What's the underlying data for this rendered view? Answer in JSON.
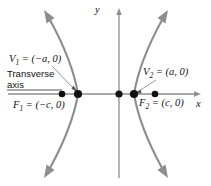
{
  "figure": {
    "type": "hyperbola-diagram",
    "axes": {
      "x_label": "x",
      "y_label": "y",
      "origin": [
        119,
        94
      ]
    },
    "labels": {
      "vertex_left": "V₁ = (−a, 0)",
      "vertex_right": "V₂ = (a, 0)",
      "focus_left": "F₁ = (−c, 0)",
      "focus_right": "F₂ = (c, 0)",
      "transverse_line1": "Transverse",
      "transverse_line2": "axis"
    },
    "points": [
      {
        "name": "focus-left",
        "label": "F₁",
        "x": 62,
        "y": 94
      },
      {
        "name": "vertex-left",
        "label": "V₁",
        "x": 78,
        "y": 94
      },
      {
        "name": "center",
        "label": "center",
        "x": 119,
        "y": 94
      },
      {
        "name": "vertex-right",
        "label": "V₂",
        "x": 134,
        "y": 94
      },
      {
        "name": "focus-right",
        "label": "F₂",
        "x": 155,
        "y": 94
      }
    ],
    "colors": {
      "curve": "#8d8d8d",
      "axis": "#8d8d8d",
      "point": "#111111",
      "text": "#111111",
      "leader": "#8d8d8d",
      "background": "#ffffff"
    }
  }
}
